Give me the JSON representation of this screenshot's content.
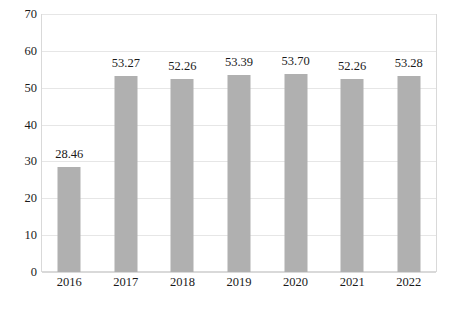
{
  "chart_data": {
    "type": "bar",
    "title": "",
    "subtitle": "",
    "xlabel": "",
    "ylabel": "",
    "categories": [
      "2016",
      "2017",
      "2018",
      "2019",
      "2020",
      "2021",
      "2022"
    ],
    "values": [
      28.46,
      53.27,
      52.26,
      53.39,
      53.7,
      52.26,
      53.28
    ],
    "data_labels": [
      "28.46",
      "53.27",
      "52.26",
      "53.39",
      "53.70",
      "52.26",
      "53.28"
    ],
    "ylim": [
      0,
      70
    ],
    "ytick_values": [
      0,
      10,
      20,
      30,
      40,
      50,
      60,
      70
    ],
    "ytick_labels": [
      "0",
      "10",
      "20",
      "30",
      "40",
      "50",
      "60",
      "70"
    ],
    "grid": true,
    "grid_axis": "y",
    "legend": false,
    "legend_position": "none",
    "bar_color": "#b0b0b0",
    "gridline_color": "#e6e6e6",
    "plot_border_color": "#d9d9d9",
    "text_color": "#1a1a1a",
    "background_color": "#ffffff"
  }
}
